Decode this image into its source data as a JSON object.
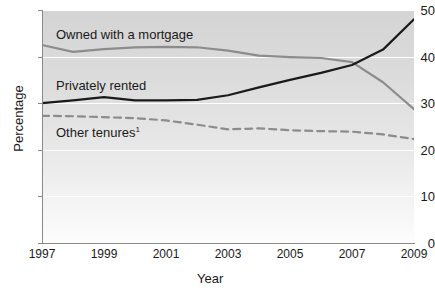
{
  "chart_data": {
    "type": "line",
    "title": "",
    "xlabel": "Year",
    "ylabel": "Percentage",
    "xlim": [
      1997,
      2009
    ],
    "ylim": [
      0,
      50
    ],
    "ytick_values": [
      0,
      10,
      20,
      30,
      40,
      50
    ],
    "ytick_labels": [
      "0",
      "10",
      "20",
      "30",
      "40",
      "50"
    ],
    "xtick_values": [
      1997,
      1999,
      2001,
      2003,
      2005,
      2007,
      2009
    ],
    "xtick_labels": [
      "1997",
      "1999",
      "2001",
      "2003",
      "2005",
      "2007",
      "2009"
    ],
    "x": [
      1997,
      1998,
      1999,
      2000,
      2001,
      2002,
      2003,
      2004,
      2005,
      2006,
      2007,
      2008,
      2009
    ],
    "grid": "horizontal-white",
    "legend": "inline-labels",
    "series": [
      {
        "name": "Owned with a mortgage",
        "label": "Owned with a mortgage",
        "style": "solid",
        "color": "#8c8c8c",
        "width": 2.2,
        "values": [
          42.5,
          41.0,
          41.6,
          42.0,
          42.1,
          42.0,
          41.3,
          40.2,
          39.9,
          39.7,
          38.8,
          34.5,
          28.7
        ]
      },
      {
        "name": "Privately rented",
        "label": "Privately rented",
        "style": "solid",
        "color": "#1a1a1a",
        "width": 2.2,
        "values": [
          30.0,
          30.6,
          31.3,
          30.6,
          30.6,
          30.7,
          31.7,
          33.4,
          35.0,
          36.5,
          38.2,
          41.5,
          48.0
        ]
      },
      {
        "name": "Other tenures",
        "label": "Other tenures",
        "label_superscript": "1",
        "style": "dashed",
        "color": "#8c8c8c",
        "width": 2.2,
        "values": [
          27.3,
          27.2,
          27.0,
          26.8,
          26.3,
          25.4,
          24.4,
          24.6,
          24.2,
          24.0,
          23.9,
          23.3,
          22.3
        ]
      }
    ],
    "series_label_positions": [
      {
        "series": "Owned with a mortgage",
        "x": 56,
        "y": 28
      },
      {
        "series": "Privately rented",
        "x": 56,
        "y": 79
      },
      {
        "series": "Other tenures",
        "x": 56,
        "y": 123
      }
    ]
  }
}
